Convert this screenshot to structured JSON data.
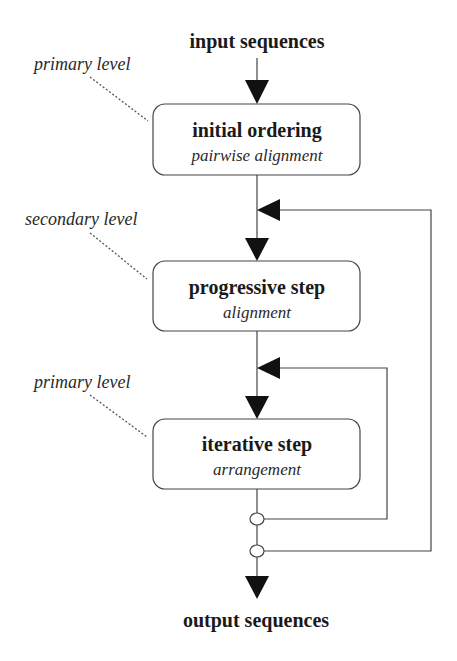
{
  "diagram": {
    "input_label": "input sequences",
    "output_label": "output sequences",
    "steps": [
      {
        "title": "initial ordering",
        "subtitle": "pairwise alignment",
        "level": "primary level"
      },
      {
        "title": "progressive step",
        "subtitle": "alignment",
        "level": "secondary level"
      },
      {
        "title": "iterative step",
        "subtitle": "arrangement",
        "level": "primary level"
      }
    ],
    "feedback_loops": [
      {
        "from": "iterative step output",
        "to": "iterative step input",
        "label": ""
      },
      {
        "from": "iterative step output",
        "to": "progressive step input",
        "label": ""
      }
    ],
    "colors": {
      "line": "#444444",
      "arrow": "#111111",
      "text": "#1a1a1a",
      "background": "#ffffff"
    }
  }
}
